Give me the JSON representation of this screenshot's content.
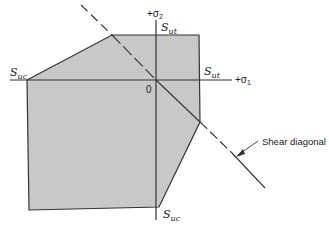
{
  "diagram": {
    "type": "failure-envelope",
    "colors": {
      "fill": "#c8c8c8",
      "stroke": "#333333",
      "background": "#ffffff"
    },
    "axes": {
      "sigma1_label": "+σ",
      "sigma1_sub": "1",
      "sigma2_label": "+σ",
      "sigma2_sub": "2",
      "origin_label": "0"
    },
    "labels": {
      "sut_top": "S",
      "sut_top_sub": "ut",
      "sut_right": "S",
      "sut_right_sub": "ut",
      "suc_left": "S",
      "suc_left_sub": "uc",
      "suc_bottom": "S",
      "suc_bottom_sub": "uc",
      "shear_diagonal": "Shear diagonal"
    },
    "polygon_points": "27,80 112,35 199,35 200,122 159,207 29,210"
  }
}
